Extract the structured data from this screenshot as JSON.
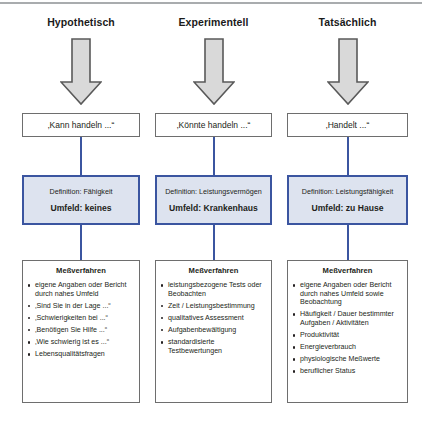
{
  "figure": {
    "top_rule_color": "#a9acae",
    "arrow_fill": "#d9d9d9",
    "arrow_stroke": "#595959",
    "box_stroke": "#6e6e6e",
    "accent_blue": "#3b55a0",
    "definition_fill": "#dde3ef"
  },
  "columns": [
    {
      "heading": "Hypothetisch",
      "arrow_icon": "down-block-arrow-icon",
      "statement": "‚Kann handeln ...“",
      "definition": "Definition: Fähigkeit",
      "umfeld": "Umfeld: keines",
      "measures_title": "Meßverfahren",
      "measures": [
        "eigene Angaben oder Bericht durch nahes Umfeld",
        "‚Sind Sie in der Lage ...“",
        "‚Schwierigkeiten bei ...“",
        "‚Benötigen Sie Hilfe ...“",
        "‚Wie schwierig ist es ...“",
        "Lebensqualitätsfragen"
      ]
    },
    {
      "heading": "Experimentell",
      "arrow_icon": "down-block-arrow-icon",
      "statement": "‚Könnte handeln ...“",
      "definition": "Definition: Leistungsvermögen",
      "umfeld": "Umfeld: Krankenhaus",
      "measures_title": "Meßverfahren",
      "measures": [
        "leistungsbezogene Tests oder Beobachten",
        "Zeit / Leistungsbestimmung",
        "qualitatives Assessment",
        "Aufgabenbewältigung",
        "standardisierte Testbewertungen"
      ]
    },
    {
      "heading": "Tatsächlich",
      "arrow_icon": "down-block-arrow-icon",
      "statement": "‚Handelt ...“",
      "definition": "Definition: Leistungsfähigkeit",
      "umfeld": "Umfeld: zu Hause",
      "measures_title": "Meßverfahren",
      "measures": [
        "eigene Angaben oder Bericht durch nahes Umfeld sowie Beobachtung",
        "Häufigkeit / Dauer bestimmter Aufgaben / Aktivitäten",
        "Produktivität",
        "Energieverbrauch",
        "physiologische Meßwerte",
        "beruflicher Status"
      ]
    }
  ]
}
